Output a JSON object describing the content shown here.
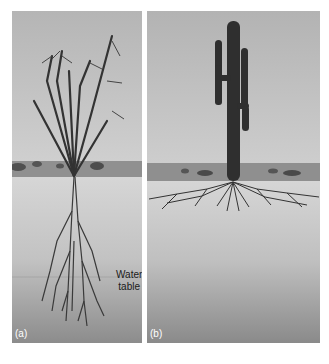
{
  "figure": {
    "panels": [
      {
        "id": "a",
        "label": "(a)",
        "subject": "ocotillo",
        "root_type": "deep taproot system reaching water table"
      },
      {
        "id": "b",
        "label": "(b)",
        "subject": "saguaro cactus",
        "root_type": "shallow, wide-spreading root system"
      }
    ],
    "annotations": {
      "water_table_line1": "Water",
      "water_table_line2": "table"
    },
    "colors": {
      "sky": "#bdbdbd",
      "horizon_ground": "#8f8f8f",
      "soil_top": "#d4d4d4",
      "soil_bottom": "#8a8a8a",
      "plant": "#2e2e2e",
      "background": "#ffffff"
    }
  }
}
